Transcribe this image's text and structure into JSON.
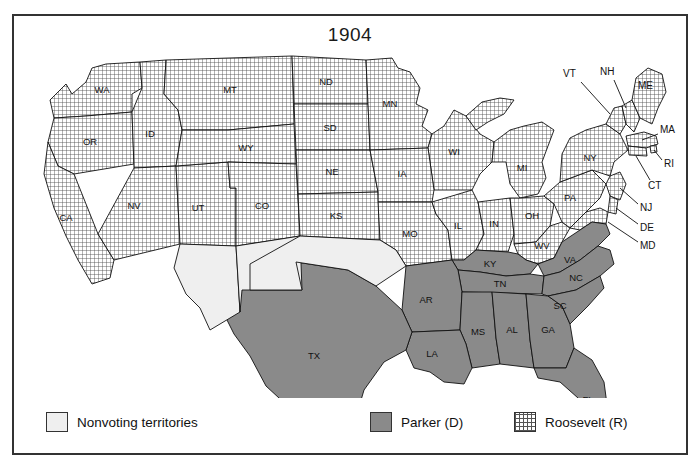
{
  "figure": {
    "title": "1904",
    "frame_border_color": "#333333",
    "background": "#ffffff"
  },
  "legend": {
    "items": [
      {
        "key": "nonvoting",
        "label": "Nonvoting territories",
        "swatch": "light-gray-square",
        "color": "#efefef"
      },
      {
        "key": "democrat",
        "label": "Parker (D)",
        "swatch": "solid-gray-square",
        "color": "#8a8a8a"
      },
      {
        "key": "republican",
        "label": "Roosevelt (R)",
        "swatch": "grid-hatch-square",
        "color": "#ffffff"
      }
    ]
  },
  "map_data": {
    "type": "choropleth-electoral-map",
    "election_year": "1904",
    "categories": {
      "republican": {
        "candidate": "Roosevelt (R)",
        "fill": "grid-hatch"
      },
      "democrat": {
        "candidate": "Parker (D)",
        "fill": "#8a8a8a"
      },
      "nonvoting": {
        "label": "Nonvoting territories",
        "fill": "#efefef"
      }
    },
    "states": [
      {
        "code": "WA",
        "result": "republican",
        "label_shown": true
      },
      {
        "code": "OR",
        "result": "republican",
        "label_shown": true
      },
      {
        "code": "CA",
        "result": "republican",
        "label_shown": true
      },
      {
        "code": "ID",
        "result": "republican",
        "label_shown": true
      },
      {
        "code": "NV",
        "result": "republican",
        "label_shown": true
      },
      {
        "code": "UT",
        "result": "republican",
        "label_shown": true
      },
      {
        "code": "MT",
        "result": "republican",
        "label_shown": true
      },
      {
        "code": "WY",
        "result": "republican",
        "label_shown": true
      },
      {
        "code": "CO",
        "result": "republican",
        "label_shown": true
      },
      {
        "code": "ND",
        "result": "republican",
        "label_shown": true
      },
      {
        "code": "SD",
        "result": "republican",
        "label_shown": true
      },
      {
        "code": "NE",
        "result": "republican",
        "label_shown": true
      },
      {
        "code": "KS",
        "result": "republican",
        "label_shown": true
      },
      {
        "code": "MN",
        "result": "republican",
        "label_shown": true
      },
      {
        "code": "IA",
        "result": "republican",
        "label_shown": true
      },
      {
        "code": "MO",
        "result": "republican",
        "label_shown": true
      },
      {
        "code": "WI",
        "result": "republican",
        "label_shown": true
      },
      {
        "code": "IL",
        "result": "republican",
        "label_shown": true
      },
      {
        "code": "MI",
        "result": "republican",
        "label_shown": true
      },
      {
        "code": "IN",
        "result": "republican",
        "label_shown": true
      },
      {
        "code": "OH",
        "result": "republican",
        "label_shown": true
      },
      {
        "code": "WV",
        "result": "republican",
        "label_shown": true
      },
      {
        "code": "PA",
        "result": "republican",
        "label_shown": true
      },
      {
        "code": "NY",
        "result": "republican",
        "label_shown": true
      },
      {
        "code": "VT",
        "result": "republican",
        "label_shown": true
      },
      {
        "code": "NH",
        "result": "republican",
        "label_shown": true
      },
      {
        "code": "ME",
        "result": "republican",
        "label_shown": true
      },
      {
        "code": "MA",
        "result": "republican",
        "label_shown": true
      },
      {
        "code": "RI",
        "result": "republican",
        "label_shown": true
      },
      {
        "code": "CT",
        "result": "republican",
        "label_shown": true
      },
      {
        "code": "NJ",
        "result": "republican",
        "label_shown": true
      },
      {
        "code": "DE",
        "result": "republican",
        "label_shown": true
      },
      {
        "code": "MD",
        "result": "republican",
        "label_shown": true
      },
      {
        "code": "TX",
        "result": "democrat",
        "label_shown": true
      },
      {
        "code": "LA",
        "result": "democrat",
        "label_shown": true
      },
      {
        "code": "AR",
        "result": "democrat",
        "label_shown": true
      },
      {
        "code": "MS",
        "result": "democrat",
        "label_shown": true
      },
      {
        "code": "AL",
        "result": "democrat",
        "label_shown": true
      },
      {
        "code": "GA",
        "result": "democrat",
        "label_shown": true
      },
      {
        "code": "FL",
        "result": "democrat",
        "label_shown": true
      },
      {
        "code": "SC",
        "result": "democrat",
        "label_shown": true
      },
      {
        "code": "NC",
        "result": "democrat",
        "label_shown": true
      },
      {
        "code": "TN",
        "result": "democrat",
        "label_shown": true
      },
      {
        "code": "KY",
        "result": "democrat",
        "label_shown": true
      },
      {
        "code": "VA",
        "result": "democrat",
        "label_shown": true
      }
    ],
    "territories": [
      {
        "name": "Arizona Territory",
        "result": "nonvoting",
        "label_shown": false
      },
      {
        "name": "New Mexico Territory",
        "result": "nonvoting",
        "label_shown": false
      },
      {
        "name": "Oklahoma / Indian Territory",
        "result": "nonvoting",
        "label_shown": false
      }
    ],
    "inset_labels": [
      {
        "code": "VT"
      },
      {
        "code": "NH"
      },
      {
        "code": "ME"
      },
      {
        "code": "MA"
      },
      {
        "code": "RI"
      },
      {
        "code": "CT"
      },
      {
        "code": "NJ"
      },
      {
        "code": "DE"
      },
      {
        "code": "MD"
      }
    ]
  },
  "labels": {
    "WA": "WA",
    "OR": "OR",
    "CA": "CA",
    "ID": "ID",
    "NV": "NV",
    "UT": "UT",
    "MT": "MT",
    "WY": "WY",
    "CO": "CO",
    "ND": "ND",
    "SD": "SD",
    "NE": "NE",
    "KS": "KS",
    "MN": "MN",
    "IA": "IA",
    "MO": "MO",
    "WI": "WI",
    "IL": "IL",
    "MI": "MI",
    "IN": "IN",
    "OH": "OH",
    "WV": "WV",
    "PA": "PA",
    "NY": "NY",
    "VT": "VT",
    "NH": "NH",
    "ME": "ME",
    "MA": "MA",
    "RI": "RI",
    "CT": "CT",
    "NJ": "NJ",
    "DE": "DE",
    "MD": "MD",
    "TX": "TX",
    "LA": "LA",
    "AR": "AR",
    "MS": "MS",
    "AL": "AL",
    "GA": "GA",
    "FL": "FL",
    "SC": "SC",
    "NC": "NC",
    "TN": "TN",
    "KY": "KY",
    "VA": "VA"
  }
}
